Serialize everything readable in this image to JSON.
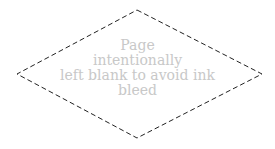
{
  "shape": {
    "type": "diamond",
    "stroke": "#222222",
    "dash": "5,3",
    "points": "137,10 262,74 137,138 17,74"
  },
  "message": {
    "lines": [
      "Page",
      "intentionally",
      "left blank to avoid ink",
      "bleed"
    ],
    "color": "#c8c8c8"
  }
}
